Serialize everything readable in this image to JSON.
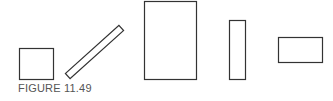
{
  "figure": {
    "caption": "FIGURE 11.49",
    "stroke_color": "#333333",
    "shapes": [
      {
        "name": "square",
        "type": "rect",
        "x": 19,
        "y": 48,
        "w": 34,
        "h": 31
      },
      {
        "name": "diagonal-rectangle",
        "type": "rotated-rect",
        "cx": 94.5,
        "cy": 52,
        "length": 72,
        "thickness": 7,
        "angle": -42
      },
      {
        "name": "tall-rectangle",
        "type": "rect",
        "x": 144,
        "y": 1,
        "w": 52,
        "h": 78
      },
      {
        "name": "narrow-vertical-rectangle",
        "type": "rect",
        "x": 229,
        "y": 20,
        "w": 16,
        "h": 59
      },
      {
        "name": "horizontal-rectangle",
        "type": "rect",
        "x": 278,
        "y": 37,
        "w": 44,
        "h": 25
      }
    ]
  }
}
